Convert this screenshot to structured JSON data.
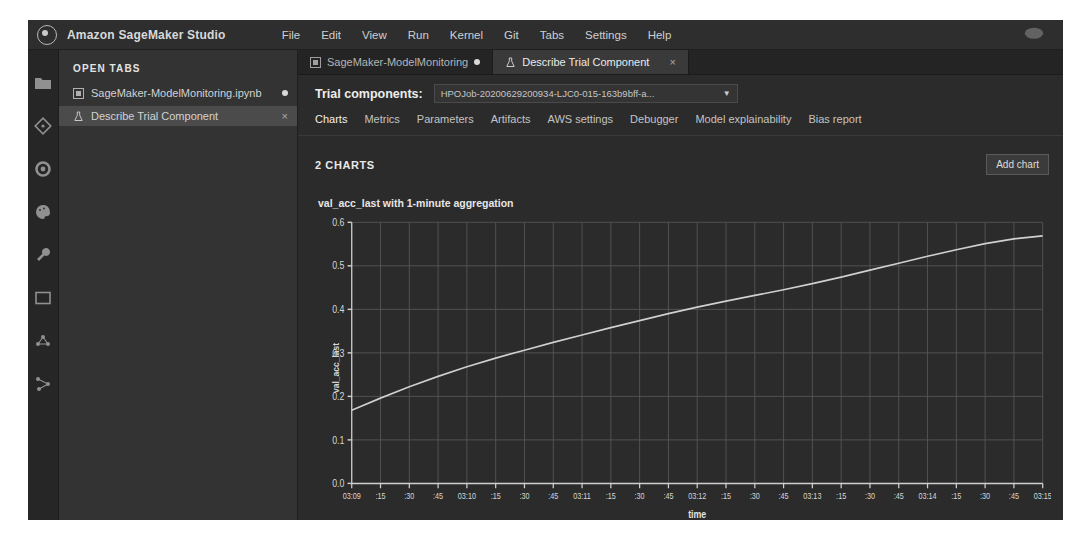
{
  "window": {
    "app_title": "Amazon SageMaker Studio",
    "logo_icon": "sagemaker-logo-icon",
    "top_right_icon": "cloud-icon"
  },
  "menubar": {
    "items": [
      {
        "label": "File"
      },
      {
        "label": "Edit"
      },
      {
        "label": "View"
      },
      {
        "label": "Run"
      },
      {
        "label": "Kernel"
      },
      {
        "label": "Git"
      },
      {
        "label": "Tabs"
      },
      {
        "label": "Settings"
      },
      {
        "label": "Help"
      }
    ]
  },
  "activitybar": {
    "items": [
      {
        "icon": "folder-icon",
        "name": "file-browser"
      },
      {
        "icon": "git-icon",
        "name": "git"
      },
      {
        "icon": "running-terminals-icon",
        "name": "running-terminals"
      },
      {
        "icon": "palette-icon",
        "name": "commands"
      },
      {
        "icon": "wrench-icon",
        "name": "tools"
      },
      {
        "icon": "window-icon",
        "name": "open-tabs"
      },
      {
        "icon": "experiments-icon",
        "name": "experiments"
      },
      {
        "icon": "pipeline-icon",
        "name": "pipelines"
      }
    ]
  },
  "leftpanel": {
    "header": "OPEN TABS",
    "tabs": [
      {
        "label": "SageMaker-ModelMonitoring.ipynb",
        "icon": "notebook-icon",
        "dirty": true,
        "active": false
      },
      {
        "label": "Describe Trial Component",
        "icon": "flask-icon",
        "dirty": false,
        "active": true,
        "close": "×"
      }
    ]
  },
  "doctabs": [
    {
      "label": "SageMaker-ModelMonitoring",
      "icon": "notebook-icon",
      "dirty": true,
      "active": false
    },
    {
      "label": "Describe Trial Component",
      "icon": "flask-icon",
      "active": true,
      "close": "×"
    }
  ],
  "trial_components": {
    "label": "Trial components:",
    "selected": "HPOJob-20200629200934-LJC0-015-163b9bff-a...",
    "caret_icon": "chevron-down-icon"
  },
  "subtabs": [
    {
      "label": "Charts",
      "active": true
    },
    {
      "label": "Metrics",
      "active": false
    },
    {
      "label": "Parameters",
      "active": false
    },
    {
      "label": "Artifacts",
      "active": false
    },
    {
      "label": "AWS settings",
      "active": false
    },
    {
      "label": "Debugger",
      "active": false
    },
    {
      "label": "Model explainability",
      "active": false
    },
    {
      "label": "Bias report",
      "active": false
    }
  ],
  "charts_header": {
    "count_label": "2 CHARTS",
    "add_chart_label": "Add chart"
  },
  "chart_data": {
    "type": "line",
    "title": "val_acc_last with 1-minute aggregation",
    "xlabel": "time",
    "ylabel": "val_acc_last",
    "grid": true,
    "legend": null,
    "line_color": "#d0d0d0",
    "xlim": [
      0,
      360
    ],
    "ylim": [
      0.0,
      0.6
    ],
    "yticks": [
      0.0,
      0.1,
      0.2,
      0.3,
      0.4,
      0.5,
      0.6
    ],
    "ytick_labels": [
      "0.0",
      "0.1",
      "0.2",
      "0.3",
      "0.4",
      "0.5",
      "0.6"
    ],
    "xticks": [
      0,
      15,
      30,
      45,
      60,
      75,
      90,
      105,
      120,
      135,
      150,
      165,
      180,
      195,
      210,
      225,
      240,
      255,
      270,
      285,
      300,
      315,
      330,
      345,
      360
    ],
    "xtick_labels": [
      "03:09",
      ":15",
      ":30",
      ":45",
      "03:10",
      ":15",
      ":30",
      ":45",
      "03:11",
      ":15",
      ":30",
      ":45",
      "03:12",
      ":15",
      ":30",
      ":45",
      "03:13",
      ":15",
      ":30",
      ":45",
      "03:14",
      ":15",
      ":30",
      ":45",
      "03:15"
    ],
    "x": [
      0,
      15,
      30,
      45,
      60,
      75,
      90,
      105,
      120,
      135,
      150,
      165,
      180,
      195,
      210,
      225,
      240,
      255,
      270,
      285,
      300,
      315,
      330,
      345,
      360
    ],
    "values": [
      0.168,
      0.196,
      0.222,
      0.246,
      0.268,
      0.288,
      0.306,
      0.324,
      0.341,
      0.358,
      0.374,
      0.39,
      0.405,
      0.419,
      0.432,
      0.445,
      0.459,
      0.474,
      0.49,
      0.506,
      0.522,
      0.537,
      0.551,
      0.562,
      0.569
    ]
  }
}
